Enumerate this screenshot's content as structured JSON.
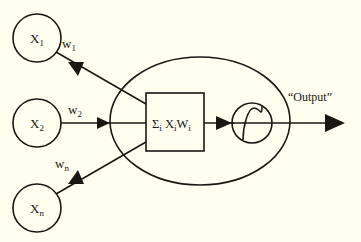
{
  "diagram": {
    "background_color": "#fffff0",
    "stroke_color": "#1a1713",
    "inputs": [
      {
        "id": "x1",
        "base": "X",
        "subscript": "1",
        "weight_base": "w",
        "weight_subscript": "1"
      },
      {
        "id": "x2",
        "base": "X",
        "subscript": "2",
        "weight_base": "w",
        "weight_subscript": "2"
      },
      {
        "id": "xn",
        "base": "X",
        "subscript": "n",
        "weight_base": "w",
        "weight_subscript": "n"
      }
    ],
    "summation": {
      "sigma": "Σ",
      "sigma_subscript": "i",
      "term_x": "X",
      "term_x_subscript": "i",
      "term_w": "W",
      "term_w_subscript": "i"
    },
    "activation": {
      "name": "sigmoid-curve",
      "shape": "s-curve"
    },
    "output": {
      "label": "“Output”"
    }
  }
}
